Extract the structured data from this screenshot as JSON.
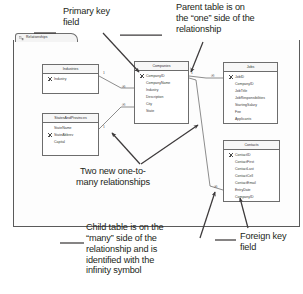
{
  "window": {
    "tab_label": "Relationships",
    "tab_icon": "relationships-icon"
  },
  "tables": [
    {
      "id": "industries",
      "title": "Industries",
      "x": 42,
      "y": 64,
      "w": 57,
      "h": 30,
      "fields": [
        {
          "name": "Industry",
          "key": true
        }
      ]
    },
    {
      "id": "statesandprovinces",
      "title": "StatesAndProvinces",
      "x": 42,
      "y": 113,
      "w": 57,
      "h": 43,
      "fields": [
        {
          "name": "StateName",
          "key": false
        },
        {
          "name": "StateAbbrev",
          "key": true
        },
        {
          "name": "Capital",
          "key": false
        }
      ]
    },
    {
      "id": "companies",
      "title": "Companies",
      "x": 134,
      "y": 61,
      "w": 55,
      "h": 63,
      "fields": [
        {
          "name": "CompanyID",
          "key": true
        },
        {
          "name": "CompanyName",
          "key": false
        },
        {
          "name": "Industry",
          "key": false
        },
        {
          "name": "Description",
          "key": false
        },
        {
          "name": "City",
          "key": false
        },
        {
          "name": "State",
          "key": false
        }
      ]
    },
    {
      "id": "jobs",
      "title": "Jobs",
      "x": 223,
      "y": 62,
      "w": 55,
      "h": 62,
      "fields": [
        {
          "name": "JobID",
          "key": true
        },
        {
          "name": "CompanyID",
          "key": false
        },
        {
          "name": "JobTitle",
          "key": false
        },
        {
          "name": "JobResponsibilities",
          "key": false
        },
        {
          "name": "StartingSalary",
          "key": false
        },
        {
          "name": "Fee",
          "key": false
        },
        {
          "name": "Applicants",
          "key": false
        }
      ]
    },
    {
      "id": "contacts",
      "title": "Contacts",
      "x": 223,
      "y": 140,
      "w": 57,
      "h": 62,
      "fields": [
        {
          "name": "ContactID",
          "key": true
        },
        {
          "name": "ContactFirst",
          "key": false
        },
        {
          "name": "ContactLast",
          "key": false
        },
        {
          "name": "ContactCell",
          "key": false
        },
        {
          "name": "ContactEmail",
          "key": false
        },
        {
          "name": "EntryDate",
          "key": false
        },
        {
          "name": "CompanyID",
          "key": false
        }
      ]
    }
  ],
  "cardinality_markers": [
    {
      "id": "industries-one",
      "symbol": "1",
      "x": 103,
      "y": 74
    },
    {
      "id": "companies-industry-many",
      "symbol": "∞",
      "x": 123,
      "y": 87
    },
    {
      "id": "companies-state-many",
      "symbol": "∞",
      "x": 123,
      "y": 106
    },
    {
      "id": "states-one",
      "symbol": "1",
      "x": 103,
      "y": 128
    },
    {
      "id": "companies-one-jobs",
      "symbol": "1",
      "x": 192,
      "y": 74
    },
    {
      "id": "jobs-many",
      "symbol": "∞",
      "x": 212,
      "y": 76
    },
    {
      "id": "contacts-many",
      "symbol": "∞",
      "x": 215,
      "y": 188
    }
  ],
  "annotations": [
    {
      "id": "primary-key-note",
      "text": "Primary key\nfield",
      "x": 63,
      "y": 8
    },
    {
      "id": "parent-table-note",
      "text": "Parent table is on\nthe “one” side of the\nrelationship",
      "x": 176,
      "y": 3
    },
    {
      "id": "two-relationships-note",
      "text": "Two new one-to-\nmany relationships",
      "x": 77,
      "y": 168
    },
    {
      "id": "child-table-note",
      "text": "Child table is on the\n“many” side of the\nrelationship and is\nidentified with the\ninfinity symbol",
      "x": 86,
      "y": 224
    },
    {
      "id": "foreign-key-note",
      "text": "Foreign key\nfield",
      "x": 240,
      "y": 233
    }
  ],
  "colors": {
    "ink": "#231f20",
    "frame": "#5a5a5a",
    "table_border": "#6d6d6d",
    "table_header": "#f7f7f7"
  }
}
